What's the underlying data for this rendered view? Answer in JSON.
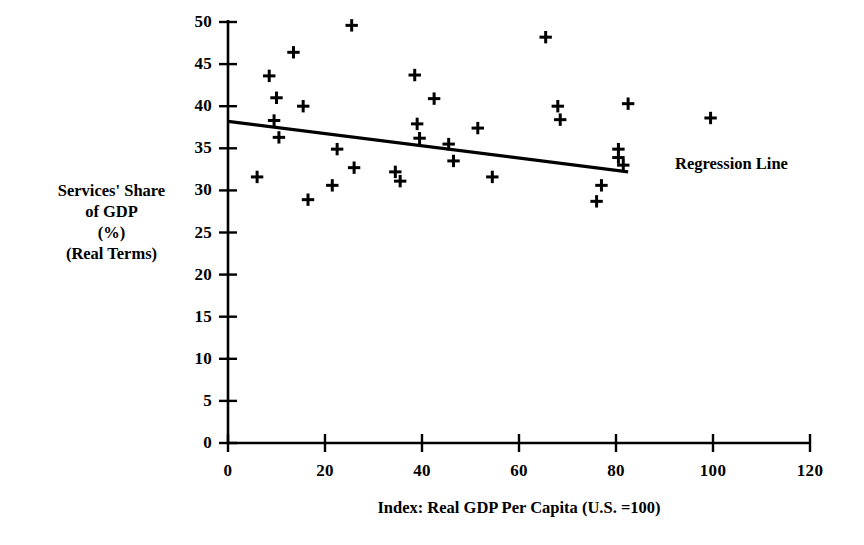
{
  "chart_data": {
    "type": "scatter",
    "title": "",
    "xlabel": "Index:  Real GDP Per Capita (U.S. =100)",
    "ylabel": "Services' Share\nof GDP\n(%)\n(Real Terms)",
    "xlim": [
      0,
      120
    ],
    "ylim": [
      0,
      50
    ],
    "xticks": [
      0,
      20,
      40,
      60,
      80,
      100,
      120
    ],
    "yticks": [
      0,
      5,
      10,
      15,
      20,
      25,
      30,
      35,
      40,
      45,
      50
    ],
    "xtick_labels": [
      "0",
      "20",
      "40",
      "60",
      "80",
      "100",
      "120"
    ],
    "ytick_labels": [
      "0",
      "5",
      "10",
      "15",
      "20",
      "25",
      "30",
      "35",
      "40",
      "45",
      "50"
    ],
    "grid": false,
    "legend": "none",
    "marker": "plus",
    "marker_color": "#000000",
    "line_color": "#000000",
    "points": [
      {
        "x": 6.0,
        "y": 31.6
      },
      {
        "x": 8.5,
        "y": 43.6
      },
      {
        "x": 9.5,
        "y": 38.3
      },
      {
        "x": 10.0,
        "y": 41.0
      },
      {
        "x": 10.5,
        "y": 36.3
      },
      {
        "x": 13.5,
        "y": 46.4
      },
      {
        "x": 15.5,
        "y": 40.0
      },
      {
        "x": 16.5,
        "y": 28.9
      },
      {
        "x": 21.5,
        "y": 30.6
      },
      {
        "x": 22.5,
        "y": 34.9
      },
      {
        "x": 25.5,
        "y": 49.6
      },
      {
        "x": 26.0,
        "y": 32.7
      },
      {
        "x": 34.5,
        "y": 32.2
      },
      {
        "x": 35.5,
        "y": 31.1
      },
      {
        "x": 38.5,
        "y": 43.7
      },
      {
        "x": 39.0,
        "y": 37.9
      },
      {
        "x": 39.5,
        "y": 36.2
      },
      {
        "x": 42.5,
        "y": 40.9
      },
      {
        "x": 45.5,
        "y": 35.5
      },
      {
        "x": 46.5,
        "y": 33.5
      },
      {
        "x": 51.5,
        "y": 37.4
      },
      {
        "x": 54.5,
        "y": 31.6
      },
      {
        "x": 65.5,
        "y": 48.2
      },
      {
        "x": 68.0,
        "y": 40.0
      },
      {
        "x": 68.5,
        "y": 38.4
      },
      {
        "x": 76.0,
        "y": 28.7
      },
      {
        "x": 77.0,
        "y": 30.6
      },
      {
        "x": 80.5,
        "y": 34.9
      },
      {
        "x": 80.5,
        "y": 33.9
      },
      {
        "x": 81.5,
        "y": 33.0
      },
      {
        "x": 82.5,
        "y": 40.3
      },
      {
        "x": 99.5,
        "y": 38.6
      }
    ],
    "regression_line": {
      "label": "Regression Line",
      "x_start": 0.0,
      "y_start": 38.2,
      "x_end": 82.5,
      "y_end": 32.2
    }
  }
}
